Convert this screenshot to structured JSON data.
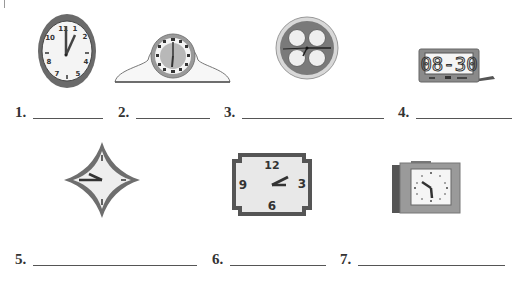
{
  "worksheet": {
    "exercises": [
      {
        "number": "1.",
        "clock_type": "oval wall clock",
        "display": "analog",
        "hour_hand": 1,
        "minute_hand": 12,
        "time_shown": "1:00"
      },
      {
        "number": "2.",
        "clock_type": "mantel clock with roman numerals",
        "display": "analog",
        "time_shown": "6:00"
      },
      {
        "number": "3.",
        "clock_type": "round wall clock with four circles",
        "display": "analog",
        "time_shown": "3:45"
      },
      {
        "number": "4.",
        "clock_type": "digital alarm clock",
        "display": "digital",
        "digits": "08:30",
        "time_shown": "8:30"
      },
      {
        "number": "5.",
        "clock_type": "diamond-shaped wall clock",
        "display": "analog",
        "time_shown": "9:45"
      },
      {
        "number": "6.",
        "clock_type": "rectangular wall clock",
        "display": "analog",
        "numerals": [
          "12",
          "3",
          "6",
          "9"
        ],
        "time_shown": "2:10"
      },
      {
        "number": "7.",
        "clock_type": "square desk clock",
        "display": "analog",
        "time_shown": "10:30"
      }
    ],
    "clock1_numerals": [
      "11",
      "1",
      "10",
      "2",
      "4",
      "8",
      "7",
      "5"
    ],
    "clock4_digits": "08-30",
    "clock6_numerals": [
      "12",
      "3",
      "6",
      "9"
    ]
  },
  "colors": {
    "frame_dark": "#5a5a5a",
    "frame_mid": "#8a8a8a",
    "face": "#f2f2f2",
    "hand": "#333333",
    "line": "#555555"
  }
}
